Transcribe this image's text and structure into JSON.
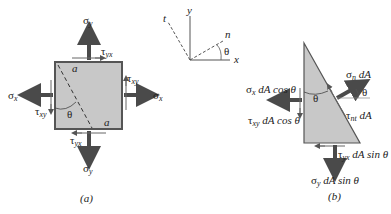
{
  "figure_a": {
    "caption": "(a)",
    "labels": {
      "sigma_y_top": "σ",
      "sigma_y_top_sub": "y",
      "sigma_y_bottom": "σ",
      "sigma_y_bottom_sub": "y",
      "sigma_x_left": "σ",
      "sigma_x_left_sub": "x",
      "sigma_x_right": "σ",
      "sigma_x_right_sub": "x",
      "tau_yx_top": "τ",
      "tau_yx_top_sub": "yx",
      "tau_yx_bottom": "τ",
      "tau_yx_bottom_sub": "yx",
      "tau_xy_right": "τ",
      "tau_xy_right_sub": "xy",
      "tau_xy_left": "τ",
      "tau_xy_left_sub": "xy",
      "plane_a_top": "a",
      "plane_a_bottom": "a",
      "theta": "θ"
    },
    "colors": {
      "element_fill": "#c8c8c8",
      "element_border": "#555555",
      "arrow": "#4a4a4a"
    }
  },
  "axes": {
    "y": "y",
    "x": "x",
    "t": "t",
    "n": "n",
    "theta": "θ"
  },
  "figure_b": {
    "caption": "(b)",
    "labels": {
      "sigma_n": "σ",
      "sigma_n_sub": "n",
      "sigma_n_rest": " dA",
      "theta_inner": "θ",
      "theta_outer": "θ",
      "sigma_x": "σ",
      "sigma_x_sub": "x",
      "sigma_x_rest": " dA cos θ",
      "tau_xy": "τ",
      "tau_xy_sub": "xy",
      "tau_xy_rest": " dA cos θ",
      "tau_nt": "τ",
      "tau_nt_sub": "nt",
      "tau_nt_rest": " dA",
      "tau_yx": "τ",
      "tau_yx_sub": "yx",
      "tau_yx_rest": " dA sin θ",
      "sigma_y": "σ",
      "sigma_y_sub": "y",
      "sigma_y_rest": " dA sin θ"
    }
  }
}
